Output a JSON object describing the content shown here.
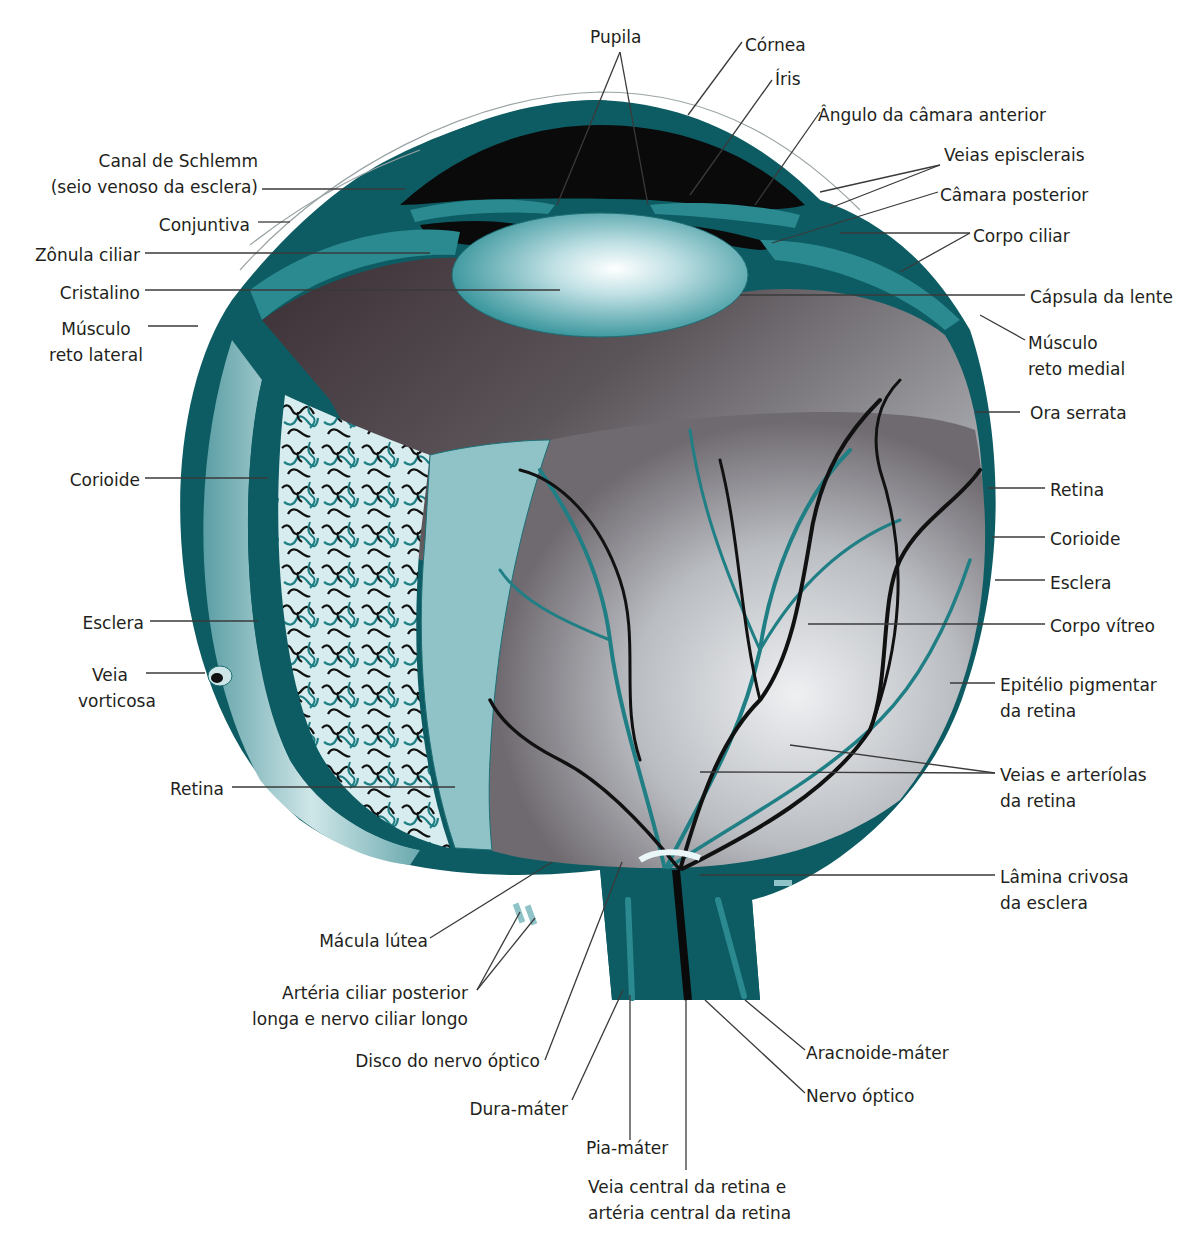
{
  "figure": {
    "type": "anatomical-diagram",
    "colors": {
      "sclera_dark": "#0d5c63",
      "sclera_mid": "#1f7a80",
      "choroid_light": "#8fc3c8",
      "lens_center": "#eaf6f8",
      "lens_edge": "#2a8a90",
      "vitreous_dark": "#3a2f33",
      "vitreous_light": "#d9dbdf",
      "anterior_chamber": "#0a0a0a",
      "vessel_vein": "#111111",
      "vessel_artery": "#1f7f84",
      "background": "#ffffff"
    }
  },
  "labels": {
    "pupila": "Pupila",
    "cornea": "Córnea",
    "iris": "Íris",
    "angulo": "Ângulo da câmara anterior",
    "veias_episclerais": "Veias episclerais",
    "camara_posterior": "Câmara posterior",
    "corpo_ciliar": "Corpo ciliar",
    "capsula_lente": "Cápsula da lente",
    "musculo_reto_medial_1": "Músculo",
    "musculo_reto_medial_2": "reto medial",
    "ora_serrata": "Ora serrata",
    "retina_r": "Retina",
    "corioide_r": "Corioide",
    "esclera_r": "Esclera",
    "corpo_vitreo": "Corpo vítreo",
    "epitelio_1": "Epitélio pigmentar",
    "epitelio_2": "da retina",
    "veias_arteriolas_1": "Veias e arteríolas",
    "veias_arteriolas_2": "da retina",
    "lamina_1": "Lâmina crivosa",
    "lamina_2": "da esclera",
    "aracnoide": "Aracnoide-máter",
    "nervo_optico": "Nervo óptico",
    "veia_central_1": "Veia central da retina e",
    "veia_central_2": "artéria central da retina",
    "pia_mater": "Pia-máter",
    "dura_mater": "Dura-máter",
    "disco_nervo": "Disco do nervo óptico",
    "arteria_ciliar_1": "Artéria ciliar posterior",
    "arteria_ciliar_2": "longa e nervo ciliar longo",
    "macula": "Mácula lútea",
    "retina_l": "Retina",
    "veia_vorticosa_1": "Veia",
    "veia_vorticosa_2": "vorticosa",
    "esclera_l": "Esclera",
    "corioide_l": "Corioide",
    "musculo_reto_lateral_1": "Músculo",
    "musculo_reto_lateral_2": "reto lateral",
    "cristalino": "Cristalino",
    "zonula": "Zônula ciliar",
    "conjuntiva": "Conjuntiva",
    "canal_schlemm_1": "Canal de Schlemm",
    "canal_schlemm_2": "(seio venoso da esclera)"
  }
}
